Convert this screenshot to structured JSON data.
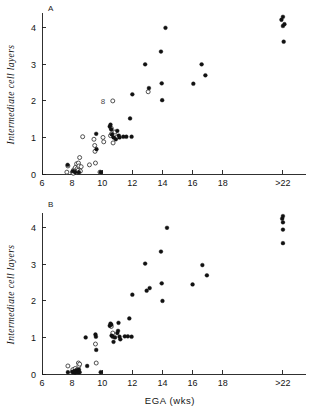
{
  "figure": {
    "panel_a_label": "A",
    "panel_b_label": "B",
    "annotation_a": "8"
  },
  "chart_data": [
    {
      "type": "scatter",
      "panel": "A",
      "title": "A",
      "xlabel": "",
      "ylabel": "Intermediate cell layers",
      "xlim": [
        6,
        23
      ],
      "ylim": [
        0,
        4.35
      ],
      "grid": false,
      "legend": "none",
      "xticks": [
        6,
        8,
        10,
        12,
        14,
        16,
        18,
        22
      ],
      "xticklabels": [
        "6",
        "8",
        "10",
        "12",
        "14",
        "16",
        "18",
        ">22"
      ],
      "yticks": [
        0,
        1,
        2,
        3,
        4
      ],
      "yticklabels": [
        "0",
        "1",
        "2",
        "3",
        "4"
      ],
      "series": [
        {
          "name": "open",
          "marker": "open-circle",
          "points": [
            [
              7.65,
              0.05
            ],
            [
              7.72,
              0.22
            ],
            [
              8.02,
              0.05
            ],
            [
              8.08,
              0.02
            ],
            [
              8.12,
              0.12
            ],
            [
              8.18,
              0.08
            ],
            [
              8.22,
              0.18
            ],
            [
              8.28,
              0.05
            ],
            [
              8.3,
              0.28
            ],
            [
              8.35,
              0.15
            ],
            [
              8.4,
              0.1
            ],
            [
              8.42,
              0.3
            ],
            [
              8.45,
              0.22
            ],
            [
              8.5,
              0.45
            ],
            [
              8.55,
              0.08
            ],
            [
              8.6,
              0.2
            ],
            [
              8.7,
              1.02
            ],
            [
              9.15,
              0.25
            ],
            [
              9.45,
              0.95
            ],
            [
              9.5,
              0.78
            ],
            [
              9.52,
              0.62
            ],
            [
              9.55,
              0.3
            ],
            [
              9.85,
              0.05
            ],
            [
              10.05,
              1.0
            ],
            [
              10.1,
              0.88
            ],
            [
              10.55,
              1.05
            ],
            [
              10.6,
              1.25
            ],
            [
              10.62,
              1.1
            ],
            [
              10.7,
              2.0
            ],
            [
              10.72,
              0.85
            ],
            [
              10.85,
              1.15
            ],
            [
              11.0,
              1.02
            ],
            [
              13.05,
              2.25
            ]
          ]
        },
        {
          "name": "filled",
          "marker": "filled-circle",
          "points": [
            [
              7.7,
              0.25
            ],
            [
              8.05,
              0.08
            ],
            [
              8.2,
              0.05
            ],
            [
              8.45,
              0.05
            ],
            [
              9.6,
              1.1
            ],
            [
              9.62,
              0.68
            ],
            [
              9.9,
              0.05
            ],
            [
              10.5,
              1.3
            ],
            [
              10.55,
              1.35
            ],
            [
              10.6,
              1.22
            ],
            [
              10.65,
              1.08
            ],
            [
              10.75,
              1.0
            ],
            [
              10.9,
              0.95
            ],
            [
              11.0,
              1.18
            ],
            [
              11.1,
              1.05
            ],
            [
              11.15,
              1.0
            ],
            [
              11.4,
              1.02
            ],
            [
              11.6,
              1.02
            ],
            [
              11.85,
              1.52
            ],
            [
              11.95,
              1.02
            ],
            [
              12.0,
              2.18
            ],
            [
              12.85,
              3.0
            ],
            [
              13.1,
              2.35
            ],
            [
              13.9,
              3.35
            ],
            [
              13.95,
              2.48
            ],
            [
              13.98,
              2.02
            ],
            [
              14.2,
              4.0
            ],
            [
              16.05,
              2.47
            ],
            [
              16.6,
              3.0
            ],
            [
              16.85,
              2.7
            ],
            [
              21.9,
              4.22
            ],
            [
              22.0,
              4.3
            ],
            [
              22.0,
              4.05
            ],
            [
              22.1,
              4.1
            ],
            [
              22.05,
              3.62
            ]
          ]
        }
      ]
    },
    {
      "type": "scatter",
      "panel": "B",
      "title": "B",
      "xlabel": "EGA (wks)",
      "ylabel": "Intermediate cell layers",
      "xlim": [
        6,
        23
      ],
      "ylim": [
        0,
        4.35
      ],
      "grid": false,
      "legend": "none",
      "xticks": [
        6,
        8,
        10,
        12,
        14,
        16,
        18,
        22
      ],
      "xticklabels": [
        "6",
        "8",
        "10",
        "12",
        "14",
        "16",
        "18",
        ">22"
      ],
      "yticks": [
        0,
        1,
        2,
        3,
        4
      ],
      "yticklabels": [
        "0",
        "1",
        "2",
        "3",
        "4"
      ],
      "series": [
        {
          "name": "open",
          "marker": "open-circle",
          "points": [
            [
              7.72,
              0.22
            ],
            [
              8.05,
              0.12
            ],
            [
              8.2,
              0.15
            ],
            [
              8.3,
              0.1
            ],
            [
              8.42,
              0.3
            ],
            [
              8.45,
              0.22
            ],
            [
              8.5,
              0.27
            ],
            [
              9.6,
              0.3
            ],
            [
              9.55,
              0.82
            ],
            [
              10.6,
              1.3
            ],
            [
              10.7,
              1.12
            ]
          ]
        },
        {
          "name": "filled",
          "marker": "filled-circle",
          "points": [
            [
              7.72,
              0.05
            ],
            [
              8.0,
              0.06
            ],
            [
              8.08,
              0.05
            ],
            [
              8.15,
              0.08
            ],
            [
              8.2,
              0.04
            ],
            [
              8.28,
              0.1
            ],
            [
              8.32,
              0.06
            ],
            [
              8.4,
              0.05
            ],
            [
              8.45,
              0.12
            ],
            [
              8.5,
              0.05
            ],
            [
              8.9,
              1.0
            ],
            [
              9.0,
              0.22
            ],
            [
              9.55,
              1.08
            ],
            [
              9.58,
              1.02
            ],
            [
              9.6,
              0.66
            ],
            [
              9.9,
              0.05
            ],
            [
              10.5,
              1.32
            ],
            [
              10.55,
              1.38
            ],
            [
              10.6,
              1.35
            ],
            [
              10.62,
              1.05
            ],
            [
              10.7,
              1.02
            ],
            [
              10.75,
              0.88
            ],
            [
              10.85,
              1.0
            ],
            [
              11.0,
              1.12
            ],
            [
              11.05,
              1.18
            ],
            [
              11.08,
              1.4
            ],
            [
              11.15,
              1.02
            ],
            [
              11.2,
              0.95
            ],
            [
              11.5,
              1.03
            ],
            [
              11.7,
              1.03
            ],
            [
              11.8,
              1.52
            ],
            [
              11.95,
              1.02
            ],
            [
              12.0,
              2.17
            ],
            [
              12.85,
              3.02
            ],
            [
              12.95,
              2.28
            ],
            [
              13.15,
              2.35
            ],
            [
              13.9,
              3.35
            ],
            [
              13.95,
              2.48
            ],
            [
              14.0,
              2.0
            ],
            [
              14.3,
              4.0
            ],
            [
              16.0,
              2.45
            ],
            [
              16.65,
              2.98
            ],
            [
              16.95,
              2.7
            ],
            [
              21.95,
              4.25
            ],
            [
              22.0,
              4.32
            ],
            [
              22.0,
              4.15
            ],
            [
              22.0,
              3.95
            ],
            [
              22.0,
              3.58
            ]
          ]
        }
      ]
    }
  ]
}
